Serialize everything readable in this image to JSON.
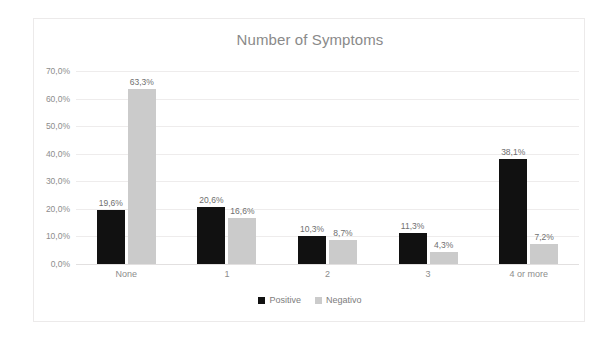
{
  "chart_data": {
    "type": "bar",
    "title": "Number of Symptoms",
    "xlabel": "",
    "ylabel": "",
    "ylim": [
      0,
      70
    ],
    "ytick_labels": [
      "0,0%",
      "10,0%",
      "20,0%",
      "30,0%",
      "40,0%",
      "50,0%",
      "60,0%",
      "70,0%"
    ],
    "ytick_values": [
      0,
      10,
      20,
      30,
      40,
      50,
      60,
      70
    ],
    "grid": true,
    "legend_position": "bottom",
    "categories": [
      "None",
      "1",
      "2",
      "3",
      "4 or more"
    ],
    "series": [
      {
        "name": "Positive",
        "color": "#111111",
        "values": [
          19.6,
          20.6,
          10.3,
          11.3,
          38.1
        ],
        "labels": [
          "19,6%",
          "20,6%",
          "10,3%",
          "11,3%",
          "38,1%"
        ]
      },
      {
        "name": "Negativo",
        "color": "#cbcbcb",
        "values": [
          63.3,
          16.6,
          8.7,
          4.3,
          7.2
        ],
        "labels": [
          "63,3%",
          "16,6%",
          "8,7%",
          "4,3%",
          "7,2%"
        ]
      }
    ]
  }
}
